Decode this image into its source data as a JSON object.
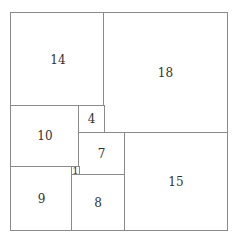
{
  "diagram": {
    "type": "squared-rectangle",
    "units": {
      "width": 32,
      "height": 33
    },
    "line_color": "#8a8a8a",
    "text_color": "#333333",
    "squares": [
      {
        "label": "14",
        "size": 14,
        "x": 0,
        "y": 0
      },
      {
        "label": "18",
        "size": 18,
        "x": 14,
        "y": 0
      },
      {
        "label": "10",
        "size": 10,
        "x": 0,
        "y": 14
      },
      {
        "label": "4",
        "size": 4,
        "x": 10,
        "y": 14
      },
      {
        "label": "7",
        "size": 7,
        "x": 10,
        "y": 18
      },
      {
        "label": "15",
        "size": 15,
        "x": 17,
        "y": 18
      },
      {
        "label": "9",
        "size": 9,
        "x": 0,
        "y": 24
      },
      {
        "label": "1",
        "size": 1,
        "x": 9,
        "y": 24
      },
      {
        "label": "8",
        "size": 8,
        "x": 9,
        "y": 25
      }
    ]
  }
}
